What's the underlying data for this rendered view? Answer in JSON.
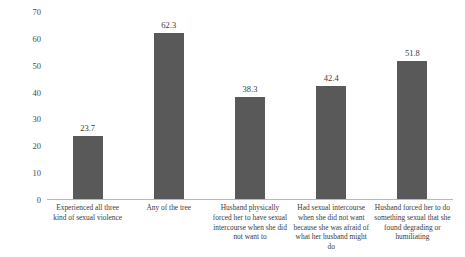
{
  "chart_data": {
    "type": "bar",
    "title": "",
    "subtitle": "",
    "xlabel": "",
    "ylabel": "",
    "ylim": [
      0,
      70
    ],
    "ytick_step": 10,
    "yticks": [
      "0",
      "10",
      "20",
      "30",
      "40",
      "50",
      "60",
      "70"
    ],
    "grid": false,
    "legend": false,
    "legend_position": "none",
    "bar_color": "#595959",
    "axis_color": "#b9b9b9",
    "text_color": "#3a3a3a",
    "categories": [
      "Experienced all three kind of sexual violence",
      "Any of the tree",
      "Husband physically forced her to have sexual intercourse when she did not want to",
      "Had sexual intercourse when she did not want because she was afraid of what her husband might do",
      "Husband forced her to do something sexual that she found degrading or humiliating"
    ],
    "values": [
      23.7,
      62.3,
      38.3,
      42.4,
      51.8
    ],
    "value_labels": [
      "23.7",
      "62.3",
      "38.3",
      "42.4",
      "51.8"
    ]
  }
}
